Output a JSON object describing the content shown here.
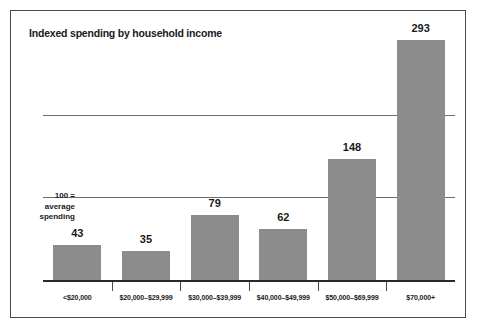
{
  "chart_data": {
    "type": "bar",
    "title": "Indexed spending by household income",
    "categories": [
      "<$20,000",
      "$20,000–$29,999",
      "$30,000–$39,999",
      "$40,000–$49,999",
      "$50,000–$69,999",
      "$70,000+"
    ],
    "values": [
      43,
      35,
      79,
      62,
      148,
      293
    ],
    "data_labels": [
      "43",
      "35",
      "79",
      "62",
      "148",
      "293"
    ],
    "xlabel": "",
    "ylabel": "",
    "ylim": [
      0,
      310
    ],
    "gridlines": [
      100,
      200
    ],
    "grid": true,
    "legend": "none",
    "annotation": {
      "line1": "100 =",
      "line2": "average",
      "line3": "spending"
    },
    "colors": {
      "bar_fill": "#8c8c8c",
      "axis": "#2a2a2a",
      "gridline": "#6e6e6e",
      "text": "#1a1a1a",
      "border": "#4a4a4a",
      "background": "#ffffff"
    }
  }
}
